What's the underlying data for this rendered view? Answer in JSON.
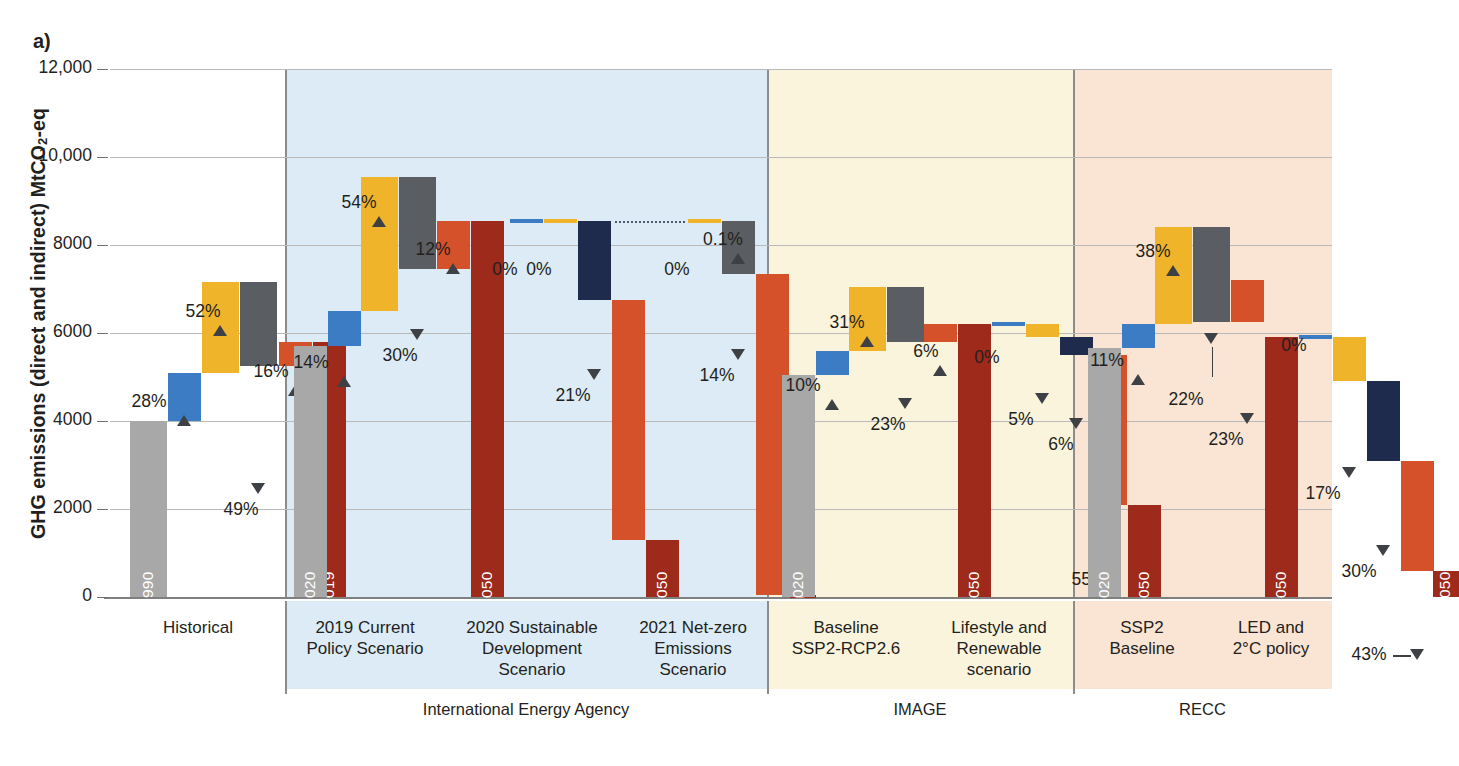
{
  "figure": {
    "panel_letter": "a)",
    "y_axis_title": "GHG emissions (direct and indirect) MtCO2-eq",
    "y_axis_title_parts": {
      "pre": "GHG emissions (direct and indirect) MtCO",
      "sub": "2",
      "post": "-eq"
    }
  },
  "chart_data": {
    "type": "bar",
    "subtype": "waterfall",
    "title": "",
    "xlabel": "",
    "ylabel": "GHG emissions (direct and indirect) MtCO2-eq",
    "ylim": [
      0,
      12000
    ],
    "yticks": [
      0,
      2000,
      4000,
      6000,
      8000,
      10000,
      12000
    ],
    "ytick_labels": [
      "0",
      "2000",
      "4000",
      "6000",
      "8000",
      "10,000",
      "12,000"
    ],
    "grid": true,
    "legend": "none",
    "units": "MtCO2-eq",
    "colors": {
      "total_start": "#a8a8a8",
      "total_end": "#9e2a1c",
      "population": "#3b7cc4",
      "affluence": "#f0b42b",
      "material_intensity": "#5a5d61",
      "energy_intensity": "#d4512a",
      "carbon_intensity": "#1e2b4d",
      "band_historical": "#ffffff",
      "band_iea": "#dcebf5",
      "band_image": "#fbf4dd",
      "band_recc": "#fae4d3"
    },
    "groups": [
      {
        "name": "International Energy Agency",
        "scenarios": [
          {
            "label": "Historical",
            "band": "historical",
            "bars": [
              {
                "kind": "total",
                "label": "1990",
                "from": 0,
                "to": 4000,
                "color": "total_start"
              },
              {
                "kind": "delta",
                "from": 4000,
                "to": 5100,
                "color": "population",
                "pct": "28%",
                "dir": "up"
              },
              {
                "kind": "delta",
                "from": 5100,
                "to": 7150,
                "color": "affluence",
                "pct": "52%",
                "dir": "up"
              },
              {
                "kind": "delta",
                "from": 7150,
                "to": 5250,
                "color": "material_intensity",
                "pct": "49%",
                "dir": "down"
              },
              {
                "kind": "delta",
                "from": 5250,
                "to": 5800,
                "color": "energy_intensity",
                "pct": "16%",
                "dir": "up"
              },
              {
                "kind": "total",
                "label": "2019",
                "from": 0,
                "to": 5800,
                "color": "total_end"
              }
            ]
          },
          {
            "label": "2019 Current Policy Scenario",
            "band": "iea",
            "bars": [
              {
                "kind": "total",
                "label": "2020",
                "from": 0,
                "to": 5700,
                "color": "total_start"
              },
              {
                "kind": "delta",
                "from": 5700,
                "to": 6500,
                "color": "population",
                "pct": "14%",
                "dir": "up"
              },
              {
                "kind": "delta",
                "from": 6500,
                "to": 9550,
                "color": "affluence",
                "pct": "54%",
                "dir": "up"
              },
              {
                "kind": "delta",
                "from": 9550,
                "to": 7450,
                "color": "material_intensity",
                "pct": "30%",
                "dir": "down"
              },
              {
                "kind": "delta",
                "from": 7450,
                "to": 8550,
                "color": "energy_intensity",
                "pct": "12%",
                "dir": "up"
              },
              {
                "kind": "total",
                "label": "2050",
                "from": 0,
                "to": 8550,
                "color": "total_end"
              }
            ]
          },
          {
            "label": "2020 Sustainable Development Scenario",
            "band": "iea",
            "bars": [
              {
                "kind": "delta-thin",
                "at": 8550,
                "color": "population",
                "pct": "0%",
                "dir": "flat"
              },
              {
                "kind": "delta-thin",
                "at": 8550,
                "color": "affluence",
                "pct": "0%",
                "dir": "flat"
              },
              {
                "kind": "delta",
                "from": 8550,
                "to": 6750,
                "color": "carbon_intensity",
                "pct": "21%",
                "dir": "down"
              },
              {
                "kind": "delta",
                "from": 6750,
                "to": 1300,
                "color": "energy_intensity",
                "pct": "64%",
                "dir": "down"
              },
              {
                "kind": "total",
                "label": "2050",
                "from": 0,
                "to": 1300,
                "color": "total_end"
              }
            ]
          },
          {
            "label": "2021 Net-zero Emissions Scenario",
            "band": "iea",
            "bars": [
              {
                "kind": "delta-thin",
                "at": 8550,
                "color": "affluence",
                "pct": "0%",
                "dir": "flat"
              },
              {
                "kind": "delta",
                "from": 8550,
                "to": 8550,
                "color": "material_intensity",
                "pct": "0.1%",
                "dir": "up"
              },
              {
                "kind": "delta",
                "from": 8550,
                "to": 7350,
                "color": "material_intensity",
                "pct": "14%",
                "dir": "down"
              },
              {
                "kind": "delta",
                "from": 7350,
                "to": 50,
                "color": "energy_intensity",
                "pct": "85%",
                "dir": "down"
              },
              {
                "kind": "total",
                "label": "2050",
                "from": 0,
                "to": 50,
                "color": "total_end"
              }
            ]
          }
        ]
      },
      {
        "name": "IMAGE",
        "scenarios": [
          {
            "label": "Baseline SSP2-RCP2.6",
            "band": "image",
            "bars": [
              {
                "kind": "total",
                "label": "2020",
                "from": 0,
                "to": 5050,
                "color": "total_start"
              },
              {
                "kind": "delta",
                "from": 5050,
                "to": 5600,
                "color": "population",
                "pct": "10%",
                "dir": "up"
              },
              {
                "kind": "delta",
                "from": 5600,
                "to": 7050,
                "color": "affluence",
                "pct": "31%",
                "dir": "up"
              },
              {
                "kind": "delta",
                "from": 7050,
                "to": 5800,
                "color": "material_intensity",
                "pct": "23%",
                "dir": "down"
              },
              {
                "kind": "delta",
                "from": 5800,
                "to": 6200,
                "color": "energy_intensity",
                "pct": "6%",
                "dir": "up"
              },
              {
                "kind": "total",
                "label": "2050",
                "from": 0,
                "to": 6200,
                "color": "total_end"
              }
            ]
          },
          {
            "label": "Lifestyle and Renewable scenario",
            "band": "image",
            "bars": [
              {
                "kind": "delta-thin",
                "at": 6200,
                "color": "population",
                "pct": "0%",
                "dir": "flat"
              },
              {
                "kind": "delta",
                "from": 6200,
                "to": 5900,
                "color": "affluence",
                "pct": "5%",
                "dir": "down"
              },
              {
                "kind": "delta",
                "from": 5900,
                "to": 5500,
                "color": "carbon_intensity",
                "pct": "6%",
                "dir": "down"
              },
              {
                "kind": "delta",
                "from": 5500,
                "to": 2100,
                "color": "energy_intensity",
                "pct": "55%",
                "dir": "down"
              },
              {
                "kind": "total",
                "label": "2050",
                "from": 0,
                "to": 2100,
                "color": "total_end"
              }
            ]
          }
        ]
      },
      {
        "name": "RECC",
        "scenarios": [
          {
            "label": "SSP2 Baseline",
            "band": "recc",
            "bars": [
              {
                "kind": "total",
                "label": "2020",
                "from": 0,
                "to": 5650,
                "color": "total_start"
              },
              {
                "kind": "delta",
                "from": 5650,
                "to": 6200,
                "color": "population",
                "pct": "11%",
                "dir": "up"
              },
              {
                "kind": "delta",
                "from": 6200,
                "to": 8400,
                "color": "affluence",
                "pct": "38%",
                "dir": "up"
              },
              {
                "kind": "delta",
                "from": 8400,
                "to": 6250,
                "color": "material_intensity",
                "pct": "22%",
                "dir": "down"
              },
              {
                "kind": "delta",
                "from": 6250,
                "to": 7200,
                "color": "energy_intensity",
                "pct": "23%",
                "dir": "down"
              },
              {
                "kind": "total",
                "label": "2050",
                "from": 0,
                "to": 5900,
                "color": "total_end"
              }
            ]
          },
          {
            "label": "LED and 2°C policy",
            "band": "recc",
            "bars": [
              {
                "kind": "delta-thin",
                "at": 5900,
                "color": "population",
                "pct": "0%",
                "dir": "flat"
              },
              {
                "kind": "delta",
                "from": 5900,
                "to": 4900,
                "color": "affluence",
                "pct": "17%",
                "dir": "down"
              },
              {
                "kind": "delta",
                "from": 4900,
                "to": 3100,
                "color": "carbon_intensity",
                "pct": "30%",
                "dir": "down"
              },
              {
                "kind": "delta",
                "from": 3100,
                "to": 600,
                "color": "energy_intensity",
                "pct": "43%",
                "dir": "down"
              },
              {
                "kind": "total",
                "label": "2050",
                "from": 0,
                "to": 600,
                "color": "total_end"
              }
            ]
          }
        ]
      }
    ],
    "annotations": [
      "28%",
      "52%",
      "49%",
      "16%",
      "14%",
      "54%",
      "30%",
      "12%",
      "0%",
      "0%",
      "21%",
      "64%",
      "0%",
      "0.1%",
      "14%",
      "85%",
      "10%",
      "31%",
      "23%",
      "6%",
      "0%",
      "5%",
      "6%",
      "55%",
      "11%",
      "38%",
      "22%",
      "23%",
      "0%",
      "17%",
      "30%",
      "43%"
    ],
    "bar_year_labels": [
      "1990",
      "2019",
      "2020",
      "2050",
      "2050",
      "2050",
      "2020",
      "2050",
      "2050",
      "2020",
      "2050",
      "2050"
    ]
  },
  "x_axis": {
    "scenario_labels": [
      "Historical",
      "2019 Current\nPolicy Scenario",
      "2020 Sustainable\nDevelopment\nScenario",
      "2021 Net-zero\nEmissions\nScenario",
      "Baseline\nSSP2-RCP2.6",
      "Lifestyle and\nRenewable\nscenario",
      "SSP2\nBaseline",
      "LED and\n2°C policy"
    ],
    "group_labels": [
      "International Energy Agency",
      "IMAGE",
      "RECC"
    ]
  }
}
